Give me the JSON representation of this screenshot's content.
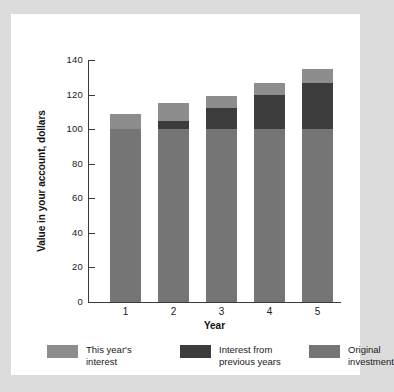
{
  "chart_data": {
    "type": "bar",
    "subtype": "stacked-bar",
    "title": "",
    "xlabel": "Year",
    "ylabel": "Value in your account, dollars",
    "categories": [
      "1",
      "2",
      "3",
      "4",
      "5"
    ],
    "ylim": [
      0,
      140
    ],
    "yticks": [
      0,
      20,
      40,
      60,
      80,
      100,
      120,
      140
    ],
    "grid": false,
    "legend_position": "bottom",
    "stack_order_bottom_to_top": [
      "Original investment",
      "Interest from previous years",
      "This year's interest"
    ],
    "series": [
      {
        "name": "Original investment",
        "color": "#757575",
        "values": [
          100,
          100,
          100,
          100,
          100
        ]
      },
      {
        "name": "Interest from previous years",
        "color": "#3c3c3c",
        "values": [
          0,
          5,
          12,
          20,
          27
        ]
      },
      {
        "name": "This year's interest",
        "color": "#8d8d8d",
        "values": [
          9,
          10,
          7,
          7,
          8
        ]
      }
    ],
    "totals": [
      109,
      115,
      119,
      127,
      135
    ]
  },
  "axes": {
    "y_tick_labels": [
      "140",
      "120",
      "100",
      "80",
      "60",
      "40",
      "20",
      "0"
    ],
    "x_tick_labels": [
      "1",
      "2",
      "3",
      "4",
      "5"
    ],
    "y_title": "Value in your account, dollars",
    "x_title": "Year"
  },
  "legend": {
    "items": [
      {
        "label": "This year's\ninterest",
        "color": "#8d8d8d"
      },
      {
        "label": "Interest from\nprevious years",
        "color": "#3c3c3c"
      },
      {
        "label": "Original\ninvestment",
        "color": "#757575"
      }
    ]
  },
  "colors": {
    "page_background": "#dcdcdc",
    "panel_background": "#ffffff",
    "axis": "#3a3a3a",
    "text": "#1a1a1a"
  }
}
